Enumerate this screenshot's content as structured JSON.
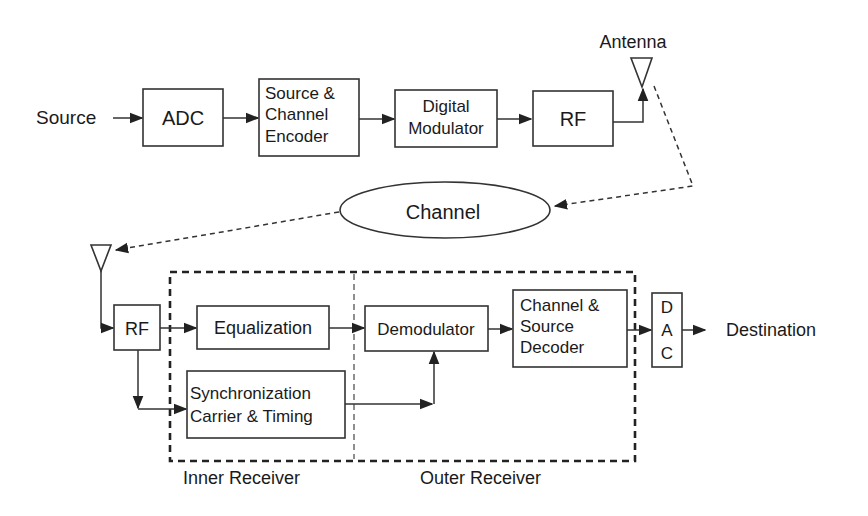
{
  "diagram": {
    "type": "block-diagram",
    "colors": {
      "stroke": "#333333",
      "text": "#1a1a1a",
      "background": "#ffffff"
    },
    "transmitter": {
      "source_label": "Source",
      "adc_label": "ADC",
      "encoder_lines": [
        "Source &",
        "Channel",
        "Encoder"
      ],
      "modulator_lines": [
        "Digital",
        "Modulator"
      ],
      "rf_label": "RF",
      "antenna_label": "Antenna"
    },
    "channel": {
      "label": "Channel"
    },
    "receiver": {
      "rf_label": "RF",
      "equalization_label": "Equalization",
      "sync_lines": [
        "Synchronization",
        "Carrier & Timing"
      ],
      "demodulator_label": "Demodulator",
      "decoder_lines": [
        "Channel &",
        "Source",
        "Decoder"
      ],
      "dac_letters": [
        "D",
        "A",
        "C"
      ],
      "destination_label": "Destination",
      "inner_receiver_label": "Inner Receiver",
      "outer_receiver_label": "Outer Receiver"
    }
  }
}
